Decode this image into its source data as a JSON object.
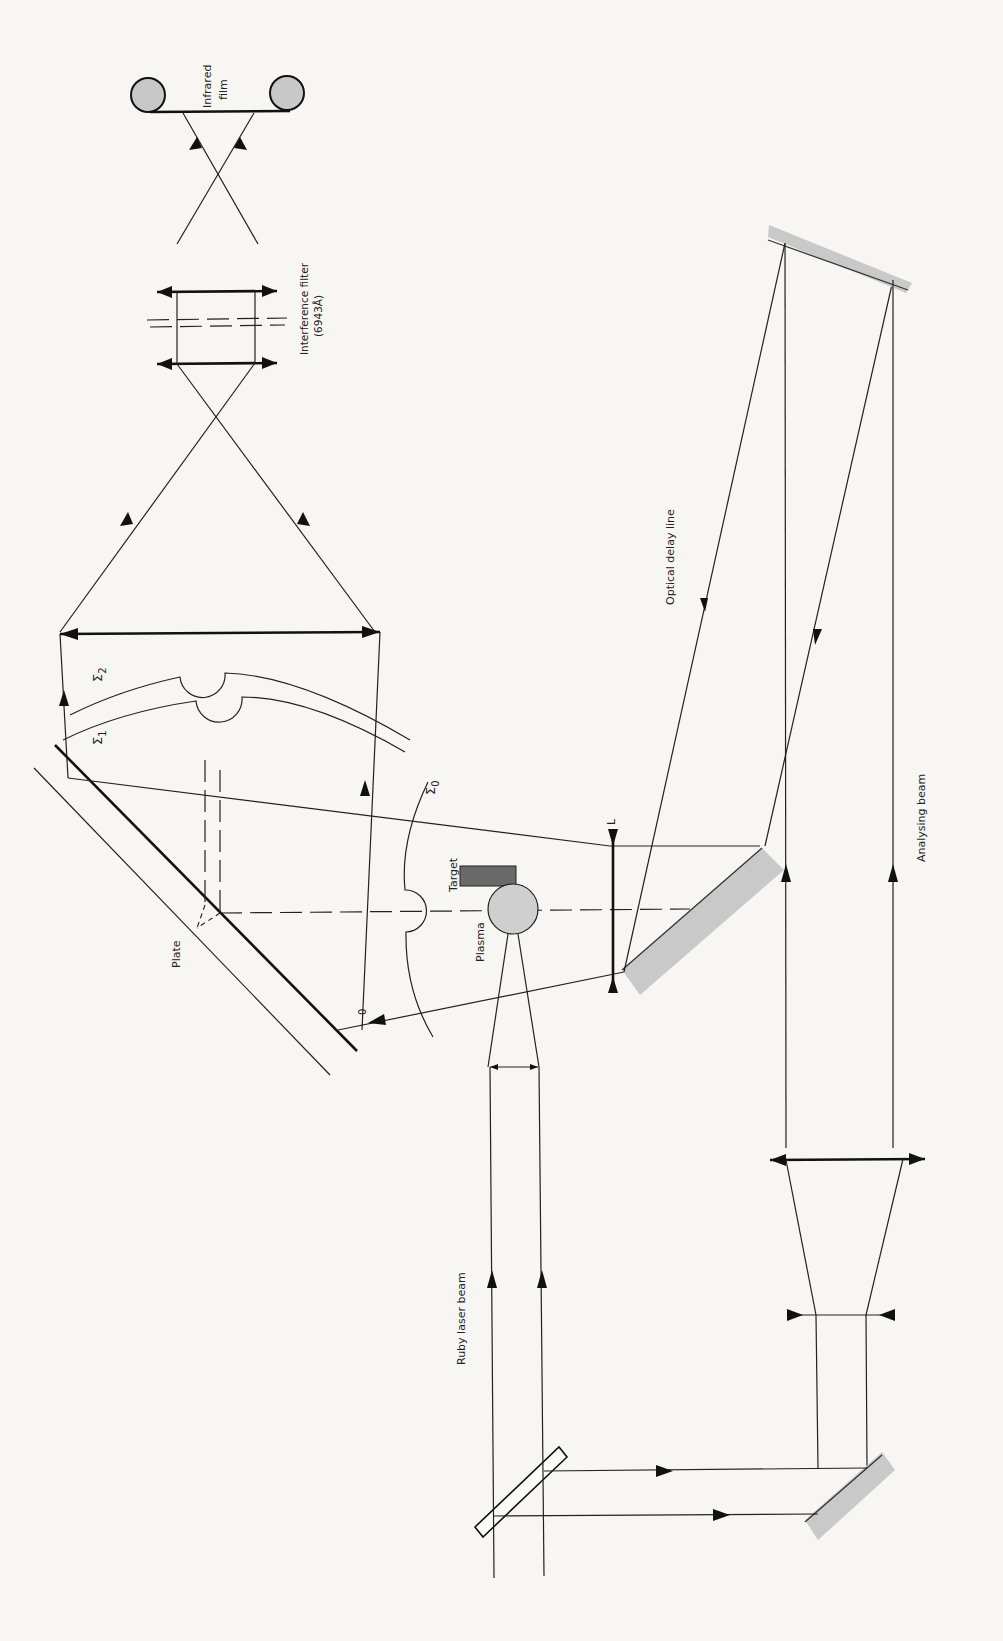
{
  "figure": {
    "type": "optical setup diagram (rotated 90°)",
    "colors": {
      "background": "#f7f6f3",
      "line": "#222222",
      "mirror_fill": "#c9c9c9",
      "target_fill": "#6a6a6a",
      "plasma_fill": "#cfcfcf"
    },
    "labels": {
      "infrared_film_line1": "Infrared",
      "infrared_film_line2": "film",
      "interference_filter_line1": "Interference filter",
      "interference_filter_line2": "(6943Å)",
      "optical_delay_line": "Optical delay line",
      "analysing_beam": "Analysing beam",
      "ruby_laser_beam": "Ruby laser beam",
      "plate": "Plate",
      "target": "Target",
      "plasma": "Plasma",
      "lens_L": "L",
      "point_O": "0",
      "sigma0": "Σ",
      "sigma0_sub": "0",
      "sigma1": "Σ",
      "sigma1_sub": "1",
      "sigma2": "Σ",
      "sigma2_sub": "2"
    },
    "components": [
      "infrared-film-spools",
      "interference-filter",
      "imaging-lens-pair",
      "collecting-lens",
      "holographic-plate",
      "wavefronts-sigma0-sigma1-sigma2",
      "target",
      "plasma",
      "lens-L",
      "delay-line-mirrors",
      "beam-expander-lenses",
      "beam-splitter",
      "turning-mirror"
    ]
  }
}
